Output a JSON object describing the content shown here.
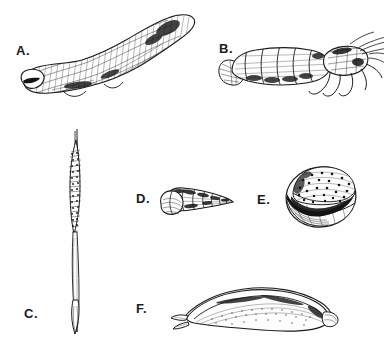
{
  "plate": {
    "title": "Marine invertebrate specimen plate",
    "background_color": "#fefefe",
    "ink_color": "#1a1a1a",
    "style": "black-and-white engraving / line drawing",
    "figure_count": 6
  },
  "figures": [
    {
      "key": "a",
      "label": "A.",
      "name": "sea-cucumber-specimen",
      "description": "Elongated cylindrical worm-like body (holothurian / sea cucumber) oriented diagonally from lower-left to upper-right, with dense cross-hatched scaly texture and a blunt rounded mouth end at lower left",
      "orientation": "diagonal lower-left to upper-right",
      "label_position": {
        "x": 16,
        "y": 44
      },
      "bounds": {
        "x": 18,
        "y": 6,
        "width": 180,
        "height": 100
      }
    },
    {
      "key": "b",
      "label": "B.",
      "name": "crustacean-specimen",
      "description": "Small shrimp or prawn-like crustacean with segmented abdomen and fan-shaped tail at left, cephalothorax at right bearing slender walking legs angled downward and fine antennae trailing to the right",
      "orientation": "horizontal, head to the right",
      "label_position": {
        "x": 219,
        "y": 42
      },
      "bounds": {
        "x": 218,
        "y": 28,
        "width": 160,
        "height": 72
      }
    },
    {
      "key": "c",
      "label": "C.",
      "name": "spindle-shell-specimen",
      "description": "Very long slender vertical spike-shaped shell; fine needle point at top, a beaded textured swollen mid-section, tapering into a narrow stalk with a small pointed bulb at the base",
      "orientation": "vertical",
      "label_position": {
        "x": 24,
        "y": 307
      },
      "bounds": {
        "x": 52,
        "y": 128,
        "width": 56,
        "height": 208
      }
    },
    {
      "key": "d",
      "label": "D.",
      "name": "turret-snail-shell-specimen",
      "description": "Small conical high-spired gastropod shell (auger / turret snail) pointing to the right, with banded whorls and a rounded aperture at the lower left",
      "orientation": "horizontal, apex to the right",
      "label_position": {
        "x": 136,
        "y": 192
      },
      "bounds": {
        "x": 155,
        "y": 182,
        "width": 80,
        "height": 40
      }
    },
    {
      "key": "e",
      "label": "E.",
      "name": "nerite-shell-specimen",
      "description": "Rounded oval globose shell with a speckled dotted upper surface and a broad dark crescent-shaped aperture opening across the lower face",
      "orientation": "aperture facing viewer",
      "label_position": {
        "x": 257,
        "y": 193
      },
      "bounds": {
        "x": 283,
        "y": 163,
        "width": 76,
        "height": 68
      }
    },
    {
      "key": "f",
      "label": "F.",
      "name": "boring-clam-specimen",
      "description": "Elongated curved bivalve shell (piddock or shipworm-type boring clam) seen in side view, arched along the top with a stippled body and a small projecting siphon end at the left",
      "orientation": "horizontal, arched",
      "label_position": {
        "x": 136,
        "y": 302
      },
      "bounds": {
        "x": 170,
        "y": 282,
        "width": 175,
        "height": 52
      }
    }
  ]
}
